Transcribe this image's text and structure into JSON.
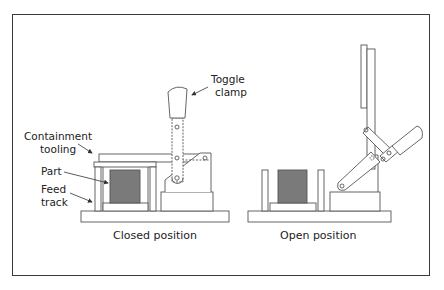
{
  "figure": {
    "labels": {
      "toggle_clamp_line1": "Toggle",
      "toggle_clamp_line2": "clamp",
      "containment_line1": "Containment",
      "containment_line2": "tooling",
      "part": "Part",
      "feed_line1": "Feed",
      "feed_line2": "track"
    },
    "captions": {
      "closed": "Closed position",
      "open": "Open position"
    },
    "colors": {
      "stroke": "#444444",
      "part_fill": "#7a7a7a",
      "frame": "#3a3a3a",
      "background": "#ffffff"
    }
  }
}
